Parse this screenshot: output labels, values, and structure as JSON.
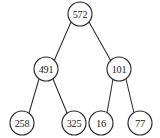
{
  "figure": {
    "name": "binary-tree-diagram",
    "background_color": "#ffffff",
    "stroke_color": "#2b2b2b",
    "text_color": "#1a1a1a"
  },
  "tree": {
    "nodes": [
      {
        "id": "root",
        "label": "572",
        "cx": 80,
        "cy": 14,
        "r": 12,
        "level": 0
      },
      {
        "id": "n-491",
        "label": "491",
        "cx": 46,
        "cy": 69,
        "r": 12,
        "level": 1
      },
      {
        "id": "n-101",
        "label": "101",
        "cx": 119,
        "cy": 69,
        "r": 12,
        "level": 1
      },
      {
        "id": "n-258",
        "label": "258",
        "cx": 22,
        "cy": 123,
        "r": 12,
        "level": 2
      },
      {
        "id": "n-325",
        "label": "325",
        "cx": 74,
        "cy": 123,
        "r": 12,
        "level": 2
      },
      {
        "id": "n-16",
        "label": "16",
        "cx": 101,
        "cy": 123,
        "r": 12,
        "level": 2
      },
      {
        "id": "n-77",
        "label": "77",
        "cx": 140,
        "cy": 123,
        "r": 12,
        "level": 2
      }
    ],
    "edges": [
      {
        "id": "edge-root-491",
        "from": "root",
        "to": "n-491",
        "x1": 71,
        "y1": 22,
        "x2": 54,
        "y2": 61
      },
      {
        "id": "edge-root-101",
        "from": "root",
        "to": "n-101",
        "x1": 89,
        "y1": 22,
        "x2": 111,
        "y2": 61
      },
      {
        "id": "edge-491-258",
        "from": "n-491",
        "to": "n-258",
        "x1": 39,
        "y1": 79,
        "x2": 29,
        "y2": 113
      },
      {
        "id": "edge-491-325",
        "from": "n-491",
        "to": "n-325",
        "x1": 53,
        "y1": 79,
        "x2": 67,
        "y2": 113
      },
      {
        "id": "edge-101-16",
        "from": "n-101",
        "to": "n-16",
        "x1": 113,
        "y1": 79,
        "x2": 107,
        "y2": 113
      },
      {
        "id": "edge-101-77",
        "from": "n-101",
        "to": "n-77",
        "x1": 126,
        "y1": 79,
        "x2": 134,
        "y2": 113
      }
    ]
  }
}
